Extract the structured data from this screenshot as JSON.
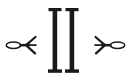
{
  "canvas": {
    "width": 134,
    "height": 81,
    "background_color": "#ffffff",
    "ink_color": "#1a1a1a"
  },
  "figure": {
    "center_numeral": {
      "label": "II",
      "glyph_count": 2,
      "glyphs": [
        {
          "name": "serif-bar-left",
          "char": "I"
        },
        {
          "name": "serif-bar-right",
          "char": "I"
        }
      ]
    },
    "left_mark": {
      "name": "dart-loop-left",
      "direction": "left",
      "parts": [
        "loop",
        "shaft",
        "arrowhead"
      ]
    },
    "right_mark": {
      "name": "dart-loop-right",
      "direction": "right",
      "parts": [
        "loop",
        "shaft",
        "arrowhead"
      ]
    }
  }
}
